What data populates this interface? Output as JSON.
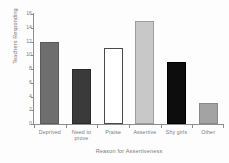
{
  "chart_data": {
    "type": "bar",
    "title": "",
    "xlabel": "Reason for Assertiveness",
    "ylabel": "Teachers Responding",
    "categories": [
      "Deprived",
      "Need to prove",
      "Praise",
      "Assertive",
      "Shy girls",
      "Other"
    ],
    "values": [
      12,
      8,
      11,
      15,
      9,
      3
    ],
    "ylim": [
      0,
      16
    ],
    "yticks": [
      0,
      2,
      4,
      6,
      8,
      10,
      12,
      14,
      16
    ],
    "ytick_labels": [
      "0",
      "2",
      "4",
      "6",
      "8",
      "10",
      "12",
      "14",
      "16"
    ],
    "grid": false,
    "legend": "none",
    "bar_colors": [
      "#6e6e6e",
      "#3a3a3a",
      "#ffffff",
      "#c8c8c8",
      "#0d0d0d",
      "#a3a3a3"
    ],
    "bar_edge_colors": [
      "#5a5a5a",
      "#2a2a2a",
      "#4a4a4a",
      "#9d9d9d",
      "#000000",
      "#888888"
    ],
    "axis_color": "#8d8d8d",
    "text_color": "#7a7a7a"
  },
  "axis": {
    "y_title": "Teachers Responding",
    "x_title": "Reason for Assertiveness"
  },
  "xticks": [
    {
      "line1": "Deprived",
      "line2": ""
    },
    {
      "line1": "Need to",
      "line2": "prove"
    },
    {
      "line1": "Praise",
      "line2": ""
    },
    {
      "line1": "Assertive",
      "line2": ""
    },
    {
      "line1": "Shy girls",
      "line2": ""
    },
    {
      "line1": "Other",
      "line2": ""
    }
  ]
}
